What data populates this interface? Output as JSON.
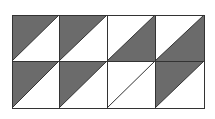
{
  "diagram": {
    "type": "triangle-tile-grid",
    "rows": 2,
    "cols": 4,
    "origin": [
      12,
      15
    ],
    "col_edges": [
      12,
      59,
      107,
      155,
      204
    ],
    "row_edges": [
      15,
      61,
      108
    ],
    "colors": {
      "dark": "#6b6b6b",
      "light": "#ffffff",
      "line": "#333333"
    },
    "cells": [
      [
        {
          "diagonal": "/",
          "shaded": "upper-left"
        },
        {
          "diagonal": "/",
          "shaded": "upper-left"
        },
        {
          "diagonal": "/",
          "shaded": "lower-right"
        },
        {
          "diagonal": "/",
          "shaded": "lower-right"
        }
      ],
      [
        {
          "diagonal": "/",
          "shaded": "upper-left"
        },
        {
          "diagonal": "/",
          "shaded": "upper-left"
        },
        {
          "diagonal": "/",
          "shaded": "none"
        },
        {
          "diagonal": "/",
          "shaded": "upper-left"
        }
      ]
    ]
  }
}
